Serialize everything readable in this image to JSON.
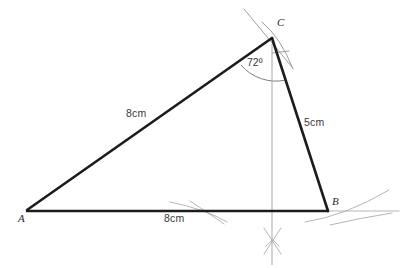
{
  "figure": {
    "type": "geometry-construction",
    "background_color": "#ffffff",
    "line_color": "#1c1c1c",
    "construction_color": "#8c8c8c"
  },
  "vertices": {
    "a": {
      "label": "A",
      "x": 27,
      "y": 210
    },
    "b": {
      "label": "B",
      "x": 328,
      "y": 211
    },
    "c": {
      "label": "C",
      "x": 272,
      "y": 38
    }
  },
  "measurements": {
    "side_ac": "8cm",
    "side_cb": "5cm",
    "side_ab": "8cm",
    "angle_c": "72º"
  },
  "artifacts": {
    "top_left": "",
    "top_right": ""
  }
}
